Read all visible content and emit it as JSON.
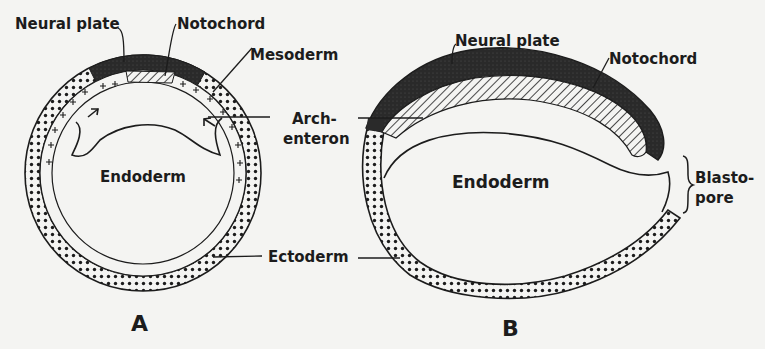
{
  "figure": {
    "panels": [
      {
        "id": "A",
        "label": "A",
        "labels": {
          "neural_plate": "Neural plate",
          "notochord": "Notochord",
          "mesoderm": "Mesoderm",
          "endoderm": "Endoderm",
          "ectoderm": "Ectoderm"
        }
      },
      {
        "id": "B",
        "label": "B",
        "labels": {
          "neural_plate": "Neural plate",
          "notochord": "Notochord",
          "endoderm": "Endoderm",
          "blastopore_line1": "Blasto-",
          "blastopore_line2": "pore"
        }
      }
    ],
    "shared_labels": {
      "archenteron_line1": "Arch-",
      "archenteron_line2": "enteron",
      "ectoderm": "Ectoderm"
    },
    "colors": {
      "background": "#f4f4f2",
      "ink": "#1c1c1c",
      "neural_plate_fill": "#2a2a2a"
    }
  }
}
